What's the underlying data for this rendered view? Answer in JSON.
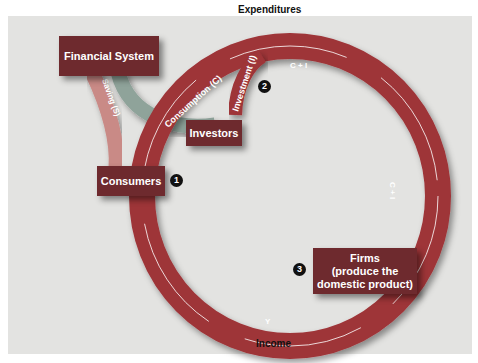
{
  "diagram": {
    "colors": {
      "background": "#e3e3e1",
      "ring": "#9e3438",
      "box": "#6e2a2e",
      "saving_tube": "#c98a86",
      "financial_tube": "#8fa39a"
    },
    "nodes": {
      "financial_system": "Financial System",
      "investors": "Investors",
      "consumers": "Consumers",
      "firms_line1": "Firms",
      "firms_line2": "(produce the",
      "firms_line3": "domestic product)"
    },
    "flows": {
      "expenditures": "Expenditures",
      "income": "Income",
      "consumption": "Consumption (C)",
      "investment": "Investment (I)",
      "saving": "Saving (S)",
      "c_plus_i_top": "C + I",
      "c_plus_i_right": "C + I",
      "y": "Y"
    },
    "markers": [
      "1",
      "2",
      "3"
    ]
  }
}
